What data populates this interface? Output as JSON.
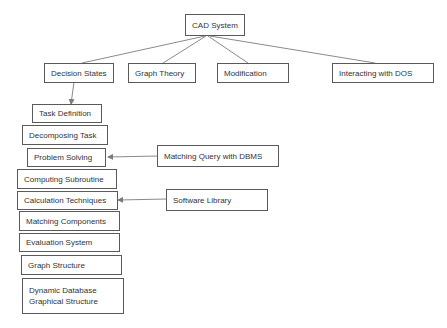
{
  "root": {
    "label": "CAD System"
  },
  "level1": [
    {
      "label": "Decision States"
    },
    {
      "label": "Graph Theory"
    },
    {
      "label": "Modification"
    },
    {
      "label": "Interacting with DOS"
    }
  ],
  "chain": [
    {
      "label": "Task Definition"
    },
    {
      "label": "Decomposing Task"
    },
    {
      "label": "Problem Solving"
    },
    {
      "label": "Computing Subroutine"
    },
    {
      "label": "Calculation Techniques"
    },
    {
      "label": "Matching Components"
    },
    {
      "label": "Evaluation System"
    },
    {
      "label": "Graph Structure"
    },
    {
      "label_line1": "Dynamic Database",
      "label_line2": "Graphical Structure"
    }
  ],
  "side_inputs": [
    {
      "label": "Matching Query with DBMS",
      "target": "Problem Solving"
    },
    {
      "label": "Software Library",
      "target": "Calculation Techniques"
    }
  ],
  "colors": {
    "line": "#7a7a7a",
    "border": "#5a5a5a",
    "text": "#333333"
  }
}
